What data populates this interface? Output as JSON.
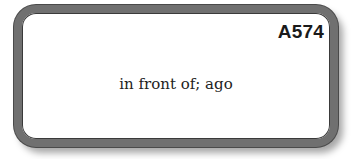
{
  "card": {
    "code": "A574",
    "definition": "in front of; ago"
  },
  "colors": {
    "border": "#707070",
    "text": "#222222",
    "background": "#ffffff"
  }
}
